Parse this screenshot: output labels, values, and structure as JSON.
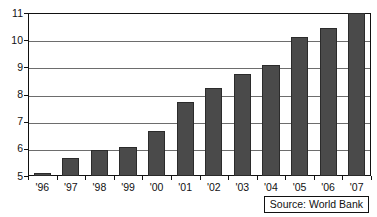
{
  "chart_data": {
    "type": "bar",
    "title": "",
    "subtitle": "",
    "xlabel": "",
    "ylabel": "",
    "categories": [
      "'96",
      "'97",
      "'98",
      "'99",
      "'00",
      "'01",
      "'02",
      "'03",
      "'04",
      "'05",
      "'06",
      "'07"
    ],
    "values": [
      5.1,
      5.65,
      5.97,
      6.08,
      6.67,
      7.72,
      8.25,
      8.75,
      9.08,
      10.12,
      10.45,
      11.0
    ],
    "ylim": [
      5,
      11
    ],
    "ytick_labels": [
      "5",
      "6",
      "7",
      "8",
      "9",
      "10",
      "11"
    ],
    "ytick_values": [
      5,
      6,
      7,
      8,
      9,
      10,
      11
    ],
    "grid": true,
    "legend": "none",
    "series": [
      {
        "name": "",
        "values": [
          5.1,
          5.65,
          5.97,
          6.08,
          6.67,
          7.72,
          8.25,
          8.75,
          9.08,
          10.12,
          10.45,
          11.0
        ]
      }
    ],
    "annotations": [
      {
        "name": "source-note",
        "text": "Source: World Bank",
        "position": "bottom-right"
      }
    ],
    "colors": {
      "bar_fill": "#4a4a4a",
      "bar_edge": "#2b2b2b",
      "axis": "#111111",
      "gridline": "#6d6d6d",
      "background": "#ffffff"
    }
  },
  "source_note": {
    "label": "Source: World Bank"
  }
}
